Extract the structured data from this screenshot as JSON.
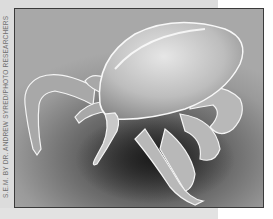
{
  "image": {
    "subject": "scanning electron micrograph of a tick",
    "credit": "S.E.M. by Dr. Andrew Syred/Photo Researchers",
    "style": "grayscale"
  },
  "colors": {
    "backing": "#dcdcdc",
    "frame_border": "#3a3a3a",
    "shadow": "#2a2a2a",
    "body_highlight": "#f0f0f0"
  }
}
